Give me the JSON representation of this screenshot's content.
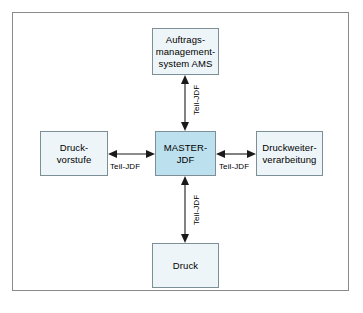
{
  "diagram": {
    "colors": {
      "frame_border": "#8a8a8a",
      "node_border": "#7d8f96",
      "node_fill": "#eef5f8",
      "center_node_fill": "#bde0ef",
      "arrow": "#1a1a1a",
      "background": "#ffffff"
    },
    "nodes": {
      "center": {
        "label": "MASTER-\nJDF",
        "role": "hub"
      },
      "top": {
        "label": "Auftrags-\nmanagement-\nsystem AMS",
        "role": "spoke"
      },
      "left": {
        "label": "Druck-\nvorstufe",
        "role": "spoke"
      },
      "right": {
        "label": "Druckweiter-\nverarbeitung",
        "role": "spoke"
      },
      "bottom": {
        "label": "Druck",
        "role": "spoke"
      }
    },
    "connectors": {
      "top": {
        "label": "Teil-JDF",
        "arrowheads": "both",
        "orientation": "vertical"
      },
      "left": {
        "label": "Teil-JDF",
        "arrowheads": "both",
        "orientation": "horizontal"
      },
      "right": {
        "label": "Teil-JDF",
        "arrowheads": "both",
        "orientation": "horizontal"
      },
      "bottom": {
        "label": "Teil-JDF",
        "arrowheads": "both",
        "orientation": "vertical"
      }
    }
  }
}
